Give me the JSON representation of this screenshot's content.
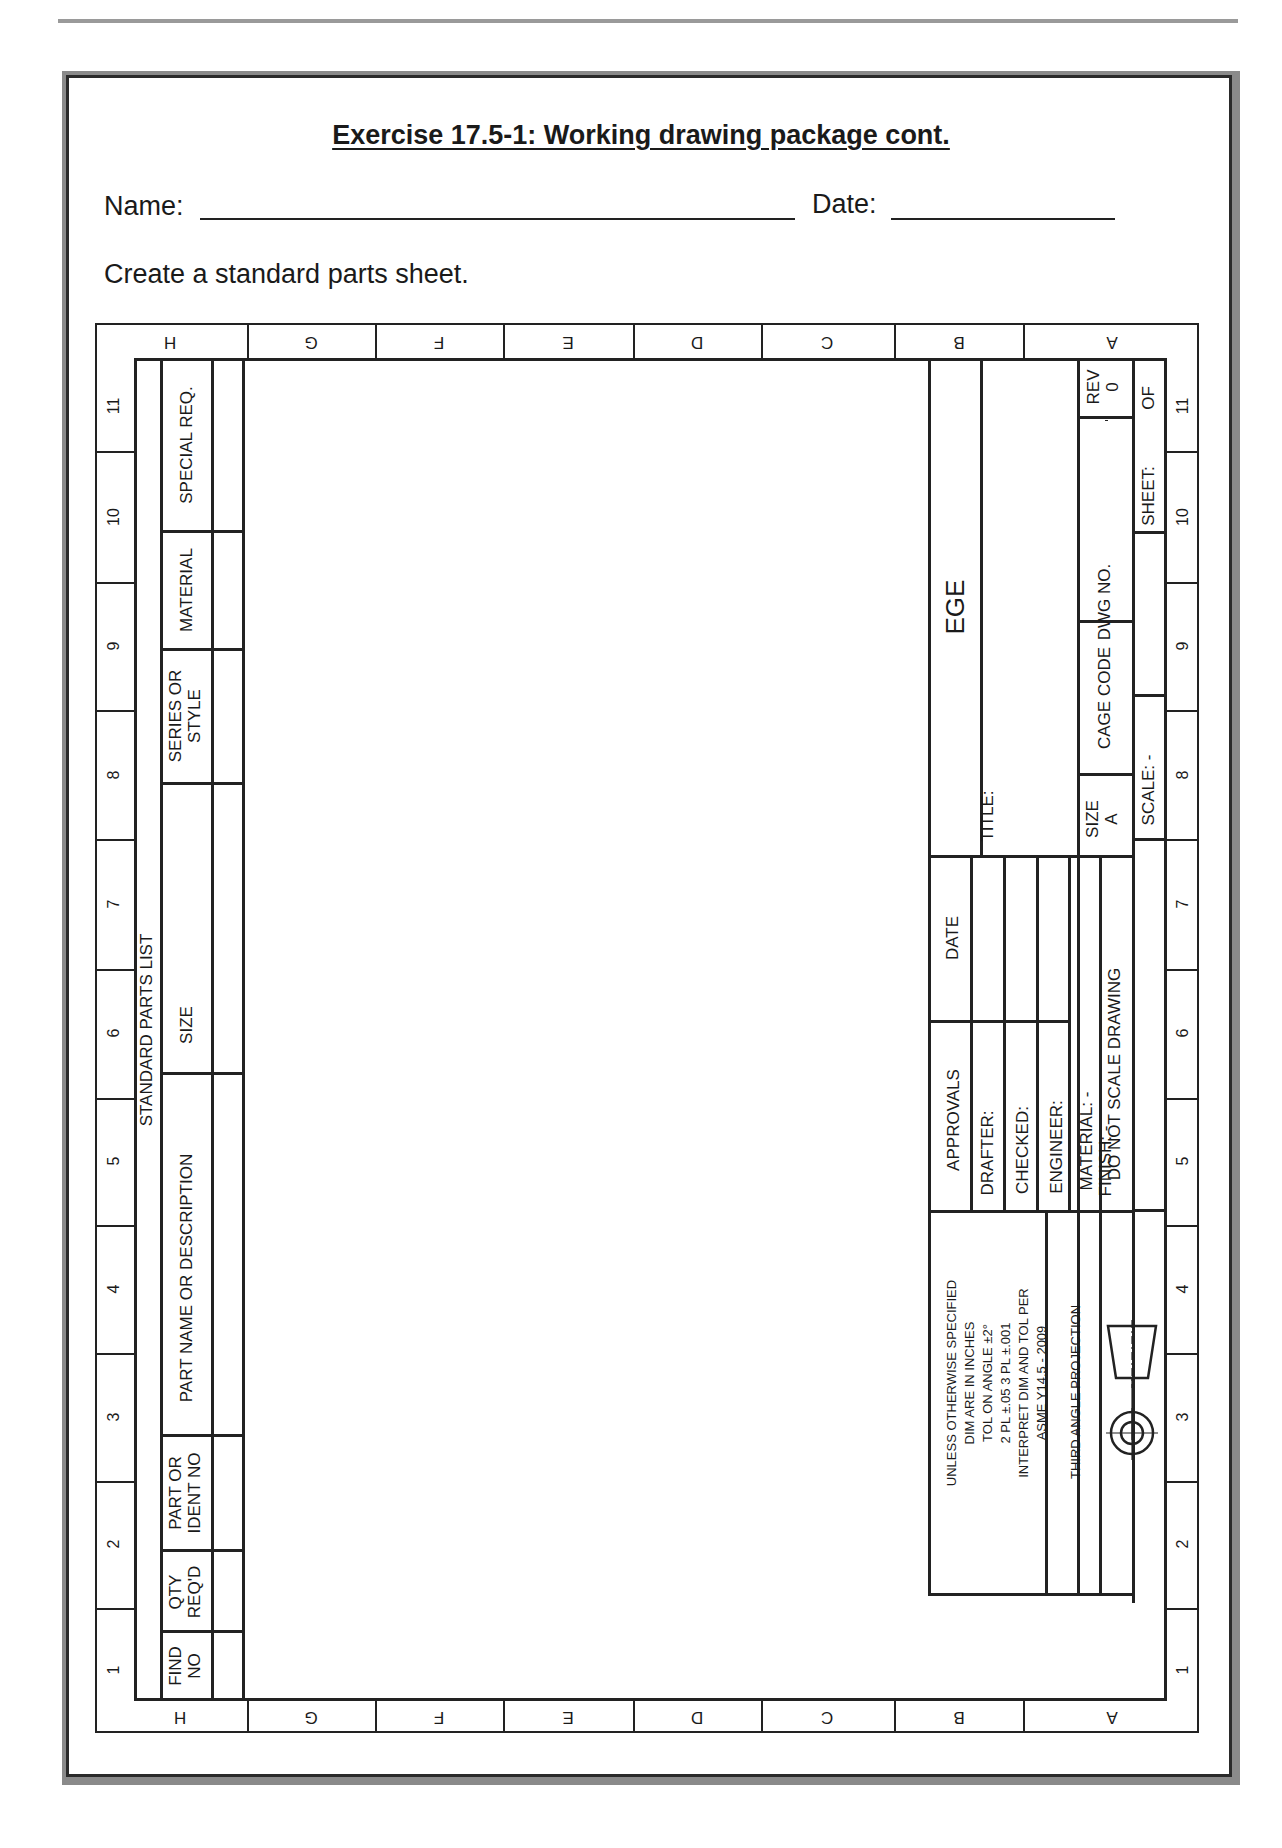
{
  "header": {
    "title": "Exercise 17.5-1:  Working drawing package cont.",
    "name_label": "Name:",
    "name_value": "",
    "date_label": "Date:",
    "date_value": "",
    "instruction": "Create a standard parts sheet."
  },
  "zones": {
    "letters": [
      "H",
      "G",
      "F",
      "E",
      "D",
      "C",
      "B",
      "A"
    ],
    "numbers": [
      "11",
      "10",
      "9",
      "8",
      "7",
      "6",
      "5",
      "4",
      "3",
      "2",
      "1"
    ]
  },
  "parts_list": {
    "title": "STANDARD PARTS LIST",
    "columns": [
      {
        "key": "find_no",
        "label": "FIND NO"
      },
      {
        "key": "qty_reqd",
        "label": "QTY REQ'D"
      },
      {
        "key": "part_or_ident_no",
        "label": "PART OR IDENT NO"
      },
      {
        "key": "part_name",
        "label": "PART NAME OR DESCRIPTION"
      },
      {
        "key": "size",
        "label": "SIZE"
      },
      {
        "key": "series_or_style",
        "label": "SERIES OR STYLE"
      },
      {
        "key": "material",
        "label": "MATERIAL"
      },
      {
        "key": "special_req",
        "label": "SPECIAL REQ."
      }
    ],
    "labels": {
      "find_no_1": "FIND",
      "find_no_2": "NO",
      "qty_1": "QTY",
      "qty_2": "REQ'D",
      "part_ident_1": "PART OR",
      "part_ident_2": "IDENT NO",
      "part_name": "PART NAME OR DESCRIPTION",
      "size": "SIZE",
      "series_1": "SERIES OR",
      "series_2": "STYLE",
      "material": "MATERIAL",
      "special": "SPECIAL REQ."
    },
    "rows": []
  },
  "title_block": {
    "company": "EGE",
    "title_label": "TITLE:",
    "size_label": "SIZE",
    "size_value": "A",
    "cage_code_label": "CAGE CODE",
    "dwg_no_label": "DWG NO.",
    "rev_label": "REV",
    "rev_value": "0",
    "scale_label": "SCALE:  -",
    "sheet_label": "SHEET:",
    "of_label": "OF",
    "approvals_label": "APPROVALS",
    "date_label": "DATE",
    "drafter_label": "DRAFTER:",
    "checked_label": "CHECKED:",
    "engineer_label": "ENGINEER:",
    "material_label": "MATERIAL:  -",
    "finish_label": "FINISH:  -",
    "do_not_scale": "DO NOT SCALE DRAWING",
    "tolerance_lines": [
      "UNLESS OTHERWISE SPECIFIED",
      "DIM ARE IN INCHES",
      "TOL ON ANGLE ±2°",
      "2 PL ±.05  3 PL ±.001",
      "INTERPRET DIM AND TOL PER",
      "ASME Y14.5 - 2009"
    ],
    "projection_label": "THIRD ANGLE PROJECTION"
  }
}
